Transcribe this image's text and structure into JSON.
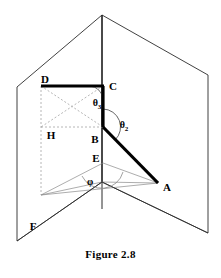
{
  "figure": {
    "caption": "Figure 2.8",
    "width": 221,
    "height": 278,
    "background_color": "#ffffff",
    "stroke_color": "#1a1a1a",
    "thick_stroke_color": "#000000",
    "dashed_stroke_color": "#9a9a9a",
    "thin_stroke_color": "#7d7d7d"
  },
  "vertices": [
    {
      "id": "D",
      "label": "D",
      "x": 45,
      "y": 79,
      "point_x": 41,
      "point_y": 86
    },
    {
      "id": "C",
      "label": "C",
      "x": 113,
      "y": 86,
      "point_x": 103,
      "point_y": 86
    },
    {
      "id": "H",
      "label": "H",
      "x": 51,
      "y": 135,
      "point_x": 41,
      "point_y": 127
    },
    {
      "id": "B",
      "label": "B",
      "x": 95,
      "y": 139,
      "point_x": 103,
      "point_y": 127
    },
    {
      "id": "E",
      "label": "E",
      "x": 96,
      "y": 158,
      "point_x": 103,
      "point_y": 163
    },
    {
      "id": "A",
      "label": "A",
      "x": 167,
      "y": 187,
      "point_x": 158,
      "point_y": 183
    },
    {
      "id": "F",
      "label": "F",
      "x": 33,
      "y": 226,
      "point_x": 41,
      "point_y": 195
    }
  ],
  "angles": [
    {
      "id": "theta3",
      "symbol": "θ",
      "subscript": "3",
      "x": 97,
      "y": 104
    },
    {
      "id": "theta2",
      "symbol": "θ",
      "subscript": "2",
      "x": 124,
      "y": 126
    },
    {
      "id": "phi",
      "symbol": "φ",
      "subscript": "",
      "x": 90,
      "y": 182
    }
  ],
  "geometry": {
    "apex": {
      "x": 102,
      "y": 15
    },
    "origin": {
      "x": 102,
      "y": 182
    },
    "left_plane": [
      [
        102,
        15
      ],
      [
        17,
        87
      ],
      [
        17,
        241
      ],
      [
        102,
        182
      ]
    ],
    "right_plane": [
      [
        102,
        15
      ],
      [
        208,
        75
      ],
      [
        208,
        233
      ],
      [
        102,
        182
      ]
    ],
    "vertical_axis": [
      [
        102,
        15
      ],
      [
        102,
        209
      ]
    ],
    "thick_segments": [
      {
        "name": "segment-DC",
        "from": [
          41,
          86
        ],
        "to": [
          104,
          86
        ]
      },
      {
        "name": "segment-CB",
        "from": [
          103,
          86
        ],
        "to": [
          103,
          127
        ]
      },
      {
        "name": "segment-BA",
        "from": [
          103,
          127
        ],
        "to": [
          158,
          183
        ]
      }
    ],
    "dashed_segments": [
      {
        "name": "segment-DF",
        "from": [
          41,
          86
        ],
        "to": [
          41,
          195
        ]
      },
      {
        "name": "segment-DB",
        "from": [
          41,
          86
        ],
        "to": [
          103,
          127
        ]
      },
      {
        "name": "segment-CH",
        "from": [
          103,
          86
        ],
        "to": [
          41,
          127
        ]
      },
      {
        "name": "segment-HB",
        "from": [
          41,
          127
        ],
        "to": [
          103,
          127
        ]
      }
    ],
    "thin_segments": [
      {
        "name": "segment-EA",
        "from": [
          103,
          163
        ],
        "to": [
          158,
          183
        ]
      },
      {
        "name": "segment-E-foot",
        "from": [
          103,
          163
        ],
        "to": [
          41,
          195
        ]
      },
      {
        "name": "segment-foot-O",
        "from": [
          41,
          195
        ],
        "to": [
          102,
          182
        ]
      },
      {
        "name": "segment-foot-A",
        "from": [
          41,
          195
        ],
        "to": [
          158,
          183
        ]
      },
      {
        "name": "segment-O-A",
        "from": [
          102,
          182
        ],
        "to": [
          158,
          183
        ]
      },
      {
        "name": "segment-base-left",
        "from": [
          102,
          182
        ],
        "to": [
          17,
          241
        ]
      },
      {
        "name": "segment-base-right",
        "from": [
          102,
          182
        ],
        "to": [
          208,
          233
        ]
      }
    ]
  }
}
